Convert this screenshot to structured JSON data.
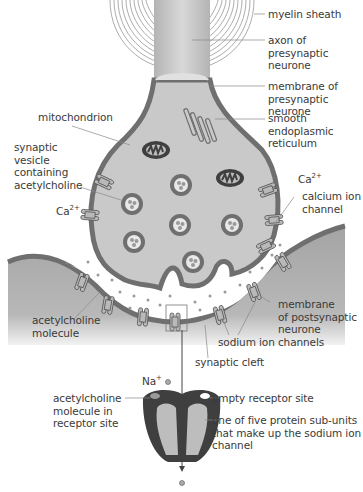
{
  "colors": {
    "membrane": "#6f6f6f",
    "cytoplasm": "#c9c9c9",
    "postsynaptic": "#a9a9a9",
    "cleft": "#ffffff",
    "dark_protein": "#3f3f3f",
    "light_protein": "#bdbdbd",
    "text": "#3a3a3a",
    "leader": "#888888"
  },
  "labels": {
    "myelin_sheath": "myelin sheath",
    "axon": "axon of presynaptic\nneurone",
    "presynaptic_membrane": "membrane of\npresynaptic neurone",
    "ser": "smooth endoplasmic\nreticulum",
    "mitochondrion": "mitochondrion",
    "synaptic_vesicle": "synaptic\nvesicle\ncontaining\nacetylcholine",
    "ca_right": "Ca",
    "ca_left": "Ca",
    "ca_charge": "2+",
    "calcium_channel": "calcium ion\nchannel",
    "ach_molecule": "acetylcholine\nmolecule",
    "postsynaptic_membrane": "membrane\nof postsynaptic\nneurone",
    "sodium_channels": "sodium ion channels",
    "synaptic_cleft": "synaptic cleft",
    "na": "Na",
    "na_charge": "+",
    "ach_in_site": "acetylcholine\nmolecule in\nreceptor site",
    "empty_site": "empty receptor site",
    "subunit": "one of five protein sub-units\nthat make up the sodium ion\nchannel"
  }
}
